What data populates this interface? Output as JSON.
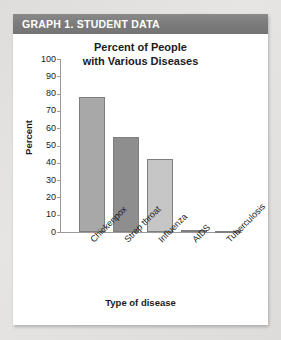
{
  "header": {
    "title": "GRAPH 1. STUDENT DATA",
    "band_color": "#7d7d7d",
    "text_color": "#ffffff"
  },
  "card": {
    "background": "#ffffff",
    "page_background": "#e9e9e7"
  },
  "axis_titles": {
    "y": "Percent",
    "x": "Type of disease"
  },
  "chart_data": {
    "type": "bar",
    "title": "Percent of People with Various Diseases",
    "title_lines": [
      "Percent of People",
      "with Various Diseases"
    ],
    "categories": [
      "Chickenpox",
      "Strep throat",
      "Influenza",
      "AIDS",
      "Tuberculosis"
    ],
    "values": [
      78,
      55,
      42,
      1,
      0
    ],
    "bar_colors": [
      "#a8a8a8",
      "#8e8e8e",
      "#c6c6c6",
      "#8e8e8e",
      "#c6c6c6"
    ],
    "bar_border_color": "#7e7e7e",
    "xlabel": "Type of disease",
    "ylabel": "Percent",
    "ylim": [
      0,
      100
    ],
    "yticks": [
      0,
      10,
      20,
      30,
      40,
      50,
      60,
      70,
      80,
      90,
      100
    ],
    "ytick_labels": [
      "0",
      "10",
      "20",
      "30",
      "40",
      "50",
      "60",
      "70",
      "80",
      "90",
      "100"
    ],
    "grid": false,
    "legend": false,
    "category_label_rotation": -45
  }
}
